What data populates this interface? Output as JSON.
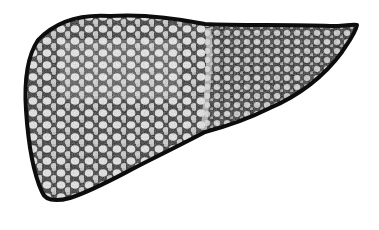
{
  "image": {
    "subject": "cirrhotic liver illustration",
    "style": "black-and-white stipple / pen-and-ink drawing",
    "colors": {
      "background": "#ffffff",
      "ink": "#111111",
      "nodule_fill": "#f2f2f2",
      "midtone": "#6a6a6a"
    },
    "regions": [
      {
        "name": "right-lobe",
        "description": "large left-side lobe with dense nodular surface"
      },
      {
        "name": "left-lobe",
        "description": "tapering lobe extending to the right tip"
      },
      {
        "name": "falciform-division",
        "description": "faint vertical division between lobes"
      }
    ]
  }
}
